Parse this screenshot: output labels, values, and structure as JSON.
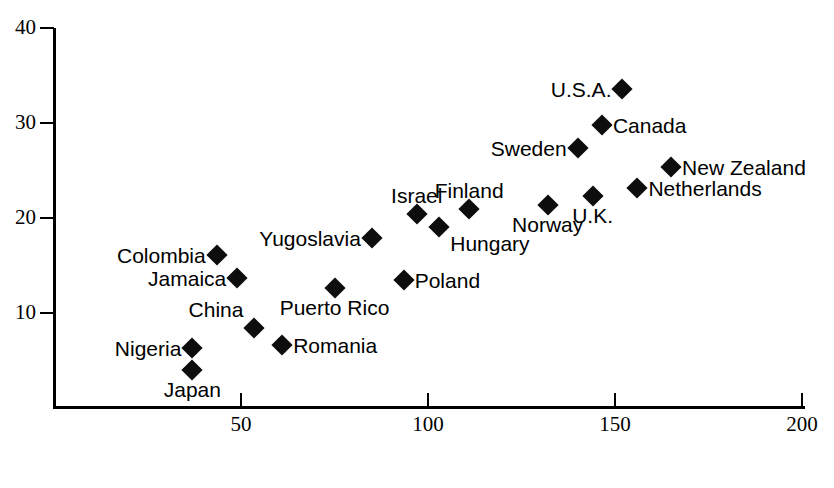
{
  "chart_data": {
    "type": "scatter",
    "title": "",
    "xlabel": "",
    "ylabel": "",
    "xlim": [
      0,
      200
    ],
    "ylim": [
      0,
      40
    ],
    "xticks": [
      50,
      100,
      150,
      200
    ],
    "yticks": [
      10,
      20,
      30,
      40
    ],
    "grid": false,
    "legend": "none",
    "marker": "filled-diamond",
    "marker_color": "#0d0d0d",
    "points": [
      {
        "label": "Japan",
        "x": 37,
        "y": 4.0,
        "label_pos": "below"
      },
      {
        "label": "Nigeria",
        "x": 37,
        "y": 6.3,
        "label_pos": "left"
      },
      {
        "label": "Colombia",
        "x": 43.5,
        "y": 16.1,
        "label_pos": "left"
      },
      {
        "label": "Jamaica",
        "x": 49,
        "y": 13.7,
        "label_pos": "left"
      },
      {
        "label": "China",
        "x": 53.6,
        "y": 8.4,
        "label_pos": "above-left"
      },
      {
        "label": "Romania",
        "x": 61,
        "y": 6.6,
        "label_pos": "right"
      },
      {
        "label": "Puerto Rico",
        "x": 75,
        "y": 12.6,
        "label_pos": "below"
      },
      {
        "label": "Yugoslavia",
        "x": 85,
        "y": 17.9,
        "label_pos": "left"
      },
      {
        "label": "Poland",
        "x": 93.5,
        "y": 13.5,
        "label_pos": "right"
      },
      {
        "label": "Israel",
        "x": 97,
        "y": 20.4,
        "label_pos": "above"
      },
      {
        "label": "Hungary",
        "x": 103,
        "y": 19.1,
        "label_pos": "below-right"
      },
      {
        "label": "Finland",
        "x": 111,
        "y": 20.9,
        "label_pos": "above"
      },
      {
        "label": "Norway",
        "x": 132,
        "y": 21.4,
        "label_pos": "below"
      },
      {
        "label": "Sweden",
        "x": 140,
        "y": 27.4,
        "label_pos": "left"
      },
      {
        "label": "U.K.",
        "x": 144,
        "y": 22.3,
        "label_pos": "below"
      },
      {
        "label": "Canada",
        "x": 146.5,
        "y": 29.8,
        "label_pos": "right"
      },
      {
        "label": "U.S.A.",
        "x": 152,
        "y": 33.6,
        "label_pos": "left"
      },
      {
        "label": "Netherlands",
        "x": 156,
        "y": 23.2,
        "label_pos": "right"
      },
      {
        "label": "New Zealand",
        "x": 165,
        "y": 25.4,
        "label_pos": "right"
      }
    ]
  },
  "axis": {
    "y_tick_labels": [
      "40",
      "30",
      "20",
      "10"
    ],
    "x_tick_labels": [
      "50",
      "100",
      "150",
      "200"
    ]
  }
}
